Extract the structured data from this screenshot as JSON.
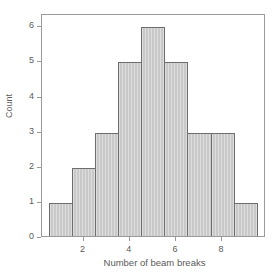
{
  "chart_data": {
    "type": "bar",
    "title": "",
    "subtitle": "",
    "xlabel": "Number of beam breaks",
    "ylabel": "Count",
    "categories": [
      1,
      2,
      3,
      4,
      5,
      6,
      7,
      8,
      9
    ],
    "values": [
      1,
      2,
      3,
      5,
      6,
      5,
      3,
      3,
      1
    ],
    "bin_width": 1,
    "bin_edges": [
      0.5,
      1.5,
      2.5,
      3.5,
      4.5,
      5.5,
      6.5,
      7.5,
      8.5,
      9.5
    ],
    "xlim": [
      0.2,
      9.9
    ],
    "ylim": [
      0,
      6.35
    ],
    "x_ticks": [
      2,
      4,
      6,
      8
    ],
    "x_tick_labels": [
      "2",
      "4",
      "6",
      "8"
    ],
    "y_ticks": [
      0,
      1,
      2,
      3,
      4,
      5,
      6
    ],
    "y_tick_labels": [
      "0",
      "1",
      "2",
      "3",
      "4",
      "5",
      "6"
    ],
    "grid": false,
    "legend": null,
    "legend_position": "none",
    "annotations": [],
    "colors": {
      "bar_fill": "#c9c9c9",
      "bar_border": "#6d6d6d",
      "frame": "#9a9a9a",
      "text": "#5a5a5a",
      "background": "#ffffff"
    }
  }
}
